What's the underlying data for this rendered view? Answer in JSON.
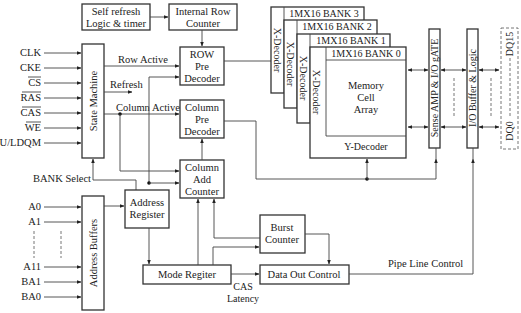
{
  "blocks": {
    "self_refresh": [
      "Self refresh",
      "Logic & timer"
    ],
    "internal_row_counter": [
      "Internal Row",
      "Counter"
    ],
    "state_machine": "State Machine",
    "row_pre_decoder": [
      "ROW",
      "Pre",
      "Decoder"
    ],
    "column_pre_decoder": [
      "Column",
      "Pre",
      "Decoder"
    ],
    "column_add_counter": [
      "Column",
      "Add",
      "Counter"
    ],
    "address_buffers": "Address Buffers",
    "address_register": [
      "Address",
      "Register"
    ],
    "mode_register": "Mode Regiter",
    "burst_counter": [
      "Burst",
      "Counter"
    ],
    "data_out_control": "Data Out Control",
    "banks": [
      "1MX16 BANK 3",
      "1MX16 BANK 2",
      "1MX16 BANK 1",
      "1MX16 BANK 0"
    ],
    "x_decoder": "X-Decoder",
    "memory_cell_array": [
      "Memory",
      "Cell",
      "Array"
    ],
    "y_decoder": "Y-Decoder",
    "sense_amp": "Sense AMP & I/O gATE",
    "io_buffer": "I/O Buffer & Logic"
  },
  "control_inputs": [
    "CLK",
    "CKE",
    "CS",
    "RAS",
    "CAS",
    "WE",
    "U/LDQM"
  ],
  "overlined_inputs": [
    "CS",
    "RAS",
    "CAS",
    "WE"
  ],
  "address_inputs": [
    "A0",
    "A1",
    "A11",
    "BA1",
    "BA0"
  ],
  "signals": {
    "row_active": "Row Active",
    "refresh": "Refresh",
    "column_active": "Column Active",
    "bank_select": "BANK Select",
    "cas_latency": [
      "CAS",
      "Latency"
    ],
    "pipe_line_control": "Pipe Line Control",
    "dq15": "DQ15",
    "dq0": "DQ0"
  }
}
